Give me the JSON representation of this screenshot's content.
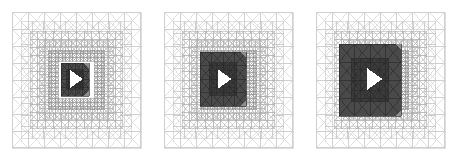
{
  "figure": {
    "title": "",
    "background_color": "#ffffff",
    "panel_count": 3
  },
  "chart_data": {
    "type": "diagram",
    "subtype": "adaptive-mesh-refinement",
    "title": "",
    "xlabel": "",
    "ylabel": "",
    "panels": [
      {
        "id": "panel-1",
        "label": "",
        "frame": {
          "x": 12,
          "y": 12,
          "w": 129,
          "h": 136
        },
        "domain_size": 1.0,
        "refined_block": {
          "x": 61,
          "y": 63,
          "w": 28,
          "h": 33
        },
        "refined_fraction": 0.21,
        "refinement_rings": 5,
        "base_cells_x": 8,
        "base_cells_y": 8,
        "body": {
          "cx": 75,
          "cy": 79,
          "size": 9,
          "shape": "right-triangle",
          "color": "#ffffff"
        },
        "mesh_color": "#b9b9b9",
        "refined_color": "#4a4a4a"
      },
      {
        "id": "panel-2",
        "label": "",
        "frame": {
          "x": 164,
          "y": 12,
          "w": 129,
          "h": 136
        },
        "domain_size": 1.0,
        "refined_block": {
          "x": 200,
          "y": 52,
          "w": 46,
          "h": 54
        },
        "refined_fraction": 0.35,
        "refinement_rings": 5,
        "base_cells_x": 8,
        "base_cells_y": 8,
        "body": {
          "cx": 223,
          "cy": 79,
          "size": 10,
          "shape": "right-triangle",
          "color": "#ffffff"
        },
        "mesh_color": "#b9b9b9",
        "refined_color": "#4a4a4a"
      },
      {
        "id": "panel-3",
        "label": "",
        "frame": {
          "x": 316,
          "y": 12,
          "w": 129,
          "h": 136
        },
        "domain_size": 1.0,
        "refined_block": {
          "x": 339,
          "y": 44,
          "w": 62,
          "h": 72
        },
        "refined_fraction": 0.48,
        "refinement_rings": 5,
        "base_cells_x": 8,
        "base_cells_y": 8,
        "body": {
          "cx": 373,
          "cy": 79,
          "size": 11,
          "shape": "right-triangle",
          "color": "#ffffff"
        },
        "mesh_color": "#b9b9b9",
        "refined_color": "#4a4a4a"
      }
    ],
    "colors": {
      "background": "#ffffff",
      "coarse_mesh": "#c2c2c2",
      "medium_mesh": "#aaaaaa",
      "fine_mesh": "#8f8f8f",
      "refined_fill": "#4a4a4a",
      "refined_fill_dark": "#3c3c3c",
      "refined_edge": "#2a2a2a",
      "body_fill": "#ffffff",
      "frame": "#cfcfcf"
    },
    "legend": {
      "entries": [],
      "position": "none"
    },
    "grid": true,
    "annotations": []
  }
}
